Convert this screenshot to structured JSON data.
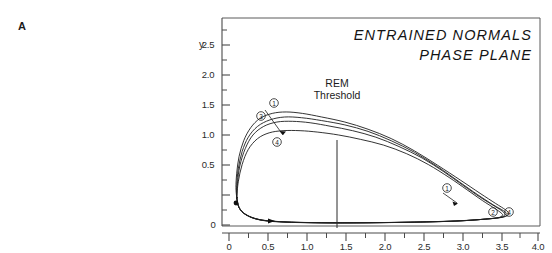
{
  "panel": {
    "label": "A"
  },
  "title": {
    "line1": "ENTRAINED NORMALS",
    "line2": "PHASE PLANE"
  },
  "axes": {
    "y_name": "y",
    "y_ticks": [
      "2.5",
      "2.0",
      "1.5",
      "1.0",
      "0.5",
      "0"
    ],
    "x_ticks": [
      "0",
      "0.5",
      "1.0",
      "1.5",
      "2.0",
      "2.5",
      "3.0",
      "3.5",
      "4.0"
    ],
    "xlim": [
      0,
      4.0
    ],
    "ylim": [
      0,
      2.5
    ]
  },
  "annotations": {
    "threshold_line1": "REM",
    "threshold_line2": "Threshold",
    "threshold_x": 1.4
  },
  "markers": {
    "upper_1": "1",
    "upper_3": "3",
    "upper_4": "4",
    "mid_1": "1",
    "right_2": "2",
    "right_4": "4"
  },
  "chart_data": {
    "type": "line",
    "subtitle": "PHASE PLANE",
    "xlabel": "",
    "ylabel": "y",
    "xlim": [
      0,
      4.0
    ],
    "ylim": [
      0,
      2.5
    ],
    "grid": false,
    "legend": "none",
    "annotations": [
      {
        "text": "REM Threshold",
        "type": "vertical-line",
        "x": 1.4,
        "y_from": 0,
        "y_to": 1.42
      },
      {
        "text": "1",
        "type": "circled-label",
        "x": 0.58,
        "y": 1.68
      },
      {
        "text": "3",
        "type": "circled-label",
        "x": 0.41,
        "y": 1.47
      },
      {
        "text": "4",
        "type": "circled-label",
        "x": 0.62,
        "y": 1.14
      },
      {
        "text": "1",
        "type": "circled-label",
        "x": 2.88,
        "y": 0.44
      },
      {
        "text": "2",
        "type": "circled-label",
        "x": 3.47,
        "y": 0.19
      },
      {
        "text": "4",
        "type": "circled-label",
        "x": 3.68,
        "y": 0.19
      },
      {
        "text": "start-point",
        "type": "filled-dot",
        "x": 0.1,
        "y": 0.38
      },
      {
        "text": "flow-arrow",
        "type": "arrow",
        "x": 0.62,
        "y": 0.06
      },
      {
        "text": "flow-arrow",
        "type": "arrow",
        "x": 3.02,
        "y": 0.33
      },
      {
        "text": "flow-arrow",
        "type": "arrow",
        "x": 0.72,
        "y": 1.05
      }
    ],
    "series": [
      {
        "name": "trajectory-1",
        "peak_y": 1.57,
        "x_max": 3.62,
        "comment": "outermost limit cycle",
        "points": [
          [
            0.1,
            0.38
          ],
          [
            0.09,
            0.52
          ],
          [
            0.1,
            0.72
          ],
          [
            0.13,
            0.95
          ],
          [
            0.19,
            1.17
          ],
          [
            0.28,
            1.35
          ],
          [
            0.4,
            1.48
          ],
          [
            0.56,
            1.55
          ],
          [
            0.74,
            1.57
          ],
          [
            0.95,
            1.55
          ],
          [
            1.2,
            1.5
          ],
          [
            1.5,
            1.43
          ],
          [
            1.8,
            1.33
          ],
          [
            2.1,
            1.2
          ],
          [
            2.4,
            1.03
          ],
          [
            2.7,
            0.83
          ],
          [
            3.0,
            0.62
          ],
          [
            3.25,
            0.44
          ],
          [
            3.45,
            0.3
          ],
          [
            3.58,
            0.21
          ],
          [
            3.62,
            0.16
          ],
          [
            3.58,
            0.12
          ],
          [
            3.4,
            0.09
          ],
          [
            3.0,
            0.06
          ],
          [
            2.4,
            0.04
          ],
          [
            1.8,
            0.03
          ],
          [
            1.2,
            0.03
          ],
          [
            0.7,
            0.04
          ],
          [
            0.4,
            0.07
          ],
          [
            0.22,
            0.14
          ],
          [
            0.13,
            0.24
          ],
          [
            0.1,
            0.38
          ]
        ]
      },
      {
        "name": "trajectory-2",
        "peak_y": 1.5,
        "x_max": 3.6,
        "comment": "second limit cycle",
        "points": [
          [
            0.1,
            0.38
          ],
          [
            0.1,
            0.55
          ],
          [
            0.12,
            0.78
          ],
          [
            0.17,
            1.02
          ],
          [
            0.25,
            1.22
          ],
          [
            0.37,
            1.37
          ],
          [
            0.53,
            1.46
          ],
          [
            0.72,
            1.5
          ],
          [
            0.94,
            1.49
          ],
          [
            1.2,
            1.45
          ],
          [
            1.5,
            1.39
          ],
          [
            1.8,
            1.3
          ],
          [
            2.1,
            1.17
          ],
          [
            2.4,
            1.01
          ],
          [
            2.7,
            0.81
          ],
          [
            2.98,
            0.6
          ],
          [
            3.22,
            0.42
          ],
          [
            3.42,
            0.28
          ],
          [
            3.55,
            0.2
          ],
          [
            3.6,
            0.15
          ],
          [
            3.55,
            0.11
          ],
          [
            3.35,
            0.085
          ],
          [
            2.95,
            0.055
          ],
          [
            2.35,
            0.04
          ],
          [
            1.75,
            0.032
          ],
          [
            1.2,
            0.032
          ],
          [
            0.7,
            0.045
          ],
          [
            0.4,
            0.075
          ],
          [
            0.22,
            0.145
          ],
          [
            0.13,
            0.245
          ],
          [
            0.1,
            0.38
          ]
        ]
      },
      {
        "name": "trajectory-3",
        "peak_y": 1.44,
        "x_max": 3.57,
        "comment": "third limit cycle",
        "points": [
          [
            0.1,
            0.38
          ],
          [
            0.11,
            0.58
          ],
          [
            0.14,
            0.82
          ],
          [
            0.21,
            1.06
          ],
          [
            0.31,
            1.25
          ],
          [
            0.45,
            1.37
          ],
          [
            0.62,
            1.43
          ],
          [
            0.82,
            1.44
          ],
          [
            1.05,
            1.42
          ],
          [
            1.32,
            1.37
          ],
          [
            1.6,
            1.31
          ],
          [
            1.9,
            1.22
          ],
          [
            2.2,
            1.09
          ],
          [
            2.5,
            0.93
          ],
          [
            2.78,
            0.74
          ],
          [
            3.03,
            0.55
          ],
          [
            3.26,
            0.38
          ],
          [
            3.44,
            0.26
          ],
          [
            3.54,
            0.19
          ],
          [
            3.57,
            0.145
          ],
          [
            3.52,
            0.108
          ],
          [
            3.32,
            0.082
          ],
          [
            2.92,
            0.054
          ],
          [
            2.32,
            0.038
          ],
          [
            1.72,
            0.031
          ],
          [
            1.18,
            0.031
          ],
          [
            0.7,
            0.044
          ],
          [
            0.4,
            0.073
          ],
          [
            0.22,
            0.143
          ],
          [
            0.13,
            0.243
          ],
          [
            0.1,
            0.38
          ]
        ]
      },
      {
        "name": "trajectory-4",
        "peak_y": 1.31,
        "x_max": 3.54,
        "comment": "innermost limit cycle",
        "points": [
          [
            0.1,
            0.38
          ],
          [
            0.12,
            0.6
          ],
          [
            0.17,
            0.84
          ],
          [
            0.25,
            1.05
          ],
          [
            0.37,
            1.2
          ],
          [
            0.52,
            1.28
          ],
          [
            0.7,
            1.31
          ],
          [
            0.92,
            1.31
          ],
          [
            1.15,
            1.29
          ],
          [
            1.42,
            1.25
          ],
          [
            1.7,
            1.19
          ],
          [
            2.0,
            1.11
          ],
          [
            2.3,
            0.99
          ],
          [
            2.58,
            0.84
          ],
          [
            2.85,
            0.66
          ],
          [
            3.08,
            0.49
          ],
          [
            3.28,
            0.34
          ],
          [
            3.44,
            0.23
          ],
          [
            3.52,
            0.17
          ],
          [
            3.54,
            0.135
          ],
          [
            3.48,
            0.1
          ],
          [
            3.28,
            0.078
          ],
          [
            2.88,
            0.052
          ],
          [
            2.28,
            0.037
          ],
          [
            1.7,
            0.03
          ],
          [
            1.18,
            0.03
          ],
          [
            0.7,
            0.043
          ],
          [
            0.4,
            0.072
          ],
          [
            0.22,
            0.142
          ],
          [
            0.13,
            0.242
          ],
          [
            0.1,
            0.38
          ]
        ]
      }
    ]
  }
}
